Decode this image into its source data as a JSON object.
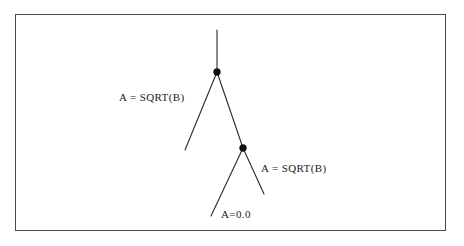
{
  "figure": {
    "type": "binary-tree-diagram",
    "background_color": "#ffffff",
    "line_color": "#2a2a2a",
    "node_color": "#111111",
    "frame": {
      "name": "outer-border",
      "x": 15,
      "y": 14,
      "width": 431,
      "height": 217,
      "border_color": "#4a4a4a"
    }
  },
  "nodes": [
    {
      "id": "node-1",
      "label": "upper-node",
      "x": 217,
      "y": 72,
      "radius": 3.4
    },
    {
      "id": "node-2",
      "label": "lower-node",
      "x": 243,
      "y": 148,
      "radius": 3.4
    }
  ],
  "edges": [
    {
      "id": "edge-trunk",
      "from_x": 217,
      "from_y": 30,
      "to_x": 217,
      "to_y": 72
    },
    {
      "id": "edge-upper-left",
      "from_x": 217,
      "from_y": 72,
      "to_x": 185,
      "to_y": 150
    },
    {
      "id": "edge-upper-right",
      "from_x": 217,
      "from_y": 72,
      "to_x": 243,
      "to_y": 148
    },
    {
      "id": "edge-lower-left",
      "from_x": 243,
      "from_y": 148,
      "to_x": 211,
      "to_y": 216
    },
    {
      "id": "edge-lower-right",
      "from_x": 243,
      "from_y": 148,
      "to_x": 264,
      "to_y": 194
    }
  ],
  "labels": {
    "left_branch": "A = SQRT(B)",
    "right_branch": "A = SQRT(B)",
    "bottom_branch": "A=0.0"
  }
}
